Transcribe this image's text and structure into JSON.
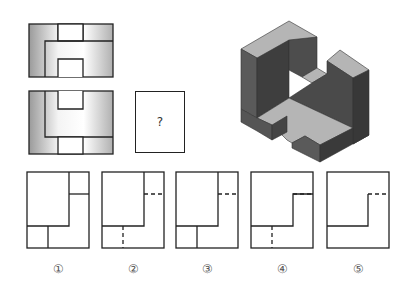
{
  "question_box": {
    "label": "?"
  },
  "views": {
    "top_view": {
      "name": "俯视图"
    },
    "front_view": {
      "name": "主视图"
    },
    "side_view": {
      "name": "左视图",
      "value": "?"
    }
  },
  "options": [
    {
      "label": "①"
    },
    {
      "label": "②"
    },
    {
      "label": "③"
    },
    {
      "label": "④"
    },
    {
      "label": "⑤"
    }
  ],
  "colors": {
    "line": "#222222",
    "dark_face": "#4a4a4a",
    "light_face": "#b8b8b8",
    "mid_face": "#6a6a6a"
  }
}
